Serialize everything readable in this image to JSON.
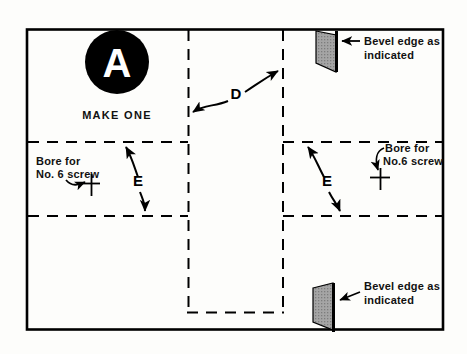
{
  "drawing": {
    "title_part": "A",
    "make_note": "MAKE ONE",
    "dimension_d": "D",
    "dimension_e_left": "E",
    "dimension_e_right": "E",
    "bore_left_line1": "Bore for",
    "bore_left_line2": "No. 6 screw",
    "bore_right_line1": "Bore for",
    "bore_right_line2": "No.6 screw",
    "bevel_top_line1": "Bevel edge as",
    "bevel_top_line2": "indicated",
    "bevel_bottom_line1": "Bevel edge as",
    "bevel_bottom_line2": "indicated",
    "colors": {
      "line": "#000000",
      "paper": "#fdfdfb",
      "bevel_fill": "#9a9a9a",
      "badge_fill": "#000000",
      "badge_text": "#ffffff"
    }
  }
}
